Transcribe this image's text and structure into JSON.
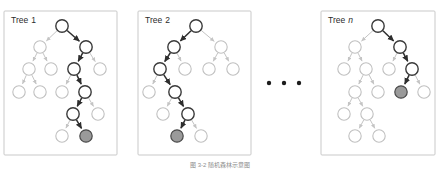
{
  "figure": {
    "caption": "图 3-2  随机森林示意图",
    "ellipsis": "• • •",
    "colors": {
      "panel_border": "#c9c9c9",
      "node_plain_stroke": "#c0c0c0",
      "node_path_stroke": "#3a3a3a",
      "leaf_fill": "#9a9a9a",
      "edge_plain": "#c4c4c4",
      "edge_path": "#2e2e2e",
      "background": "#ffffff",
      "label_text": "#2b2b2b"
    }
  },
  "panels": [
    {
      "id": "tree-1",
      "label_prefix": "Tree",
      "label_value": "1",
      "label_italic": false,
      "box": {
        "x": 4,
        "y": 11,
        "w": 113,
        "h": 144
      },
      "node_r": 6.2,
      "nodes": [
        {
          "id": "n0",
          "x": 62,
          "y": 26,
          "state": "path"
        },
        {
          "id": "n1",
          "x": 40,
          "y": 47,
          "state": "plain"
        },
        {
          "id": "n2",
          "x": 86,
          "y": 47,
          "state": "path"
        },
        {
          "id": "n3",
          "x": 29,
          "y": 69,
          "state": "plain"
        },
        {
          "id": "n4",
          "x": 51,
          "y": 69,
          "state": "plain"
        },
        {
          "id": "n5",
          "x": 74,
          "y": 69,
          "state": "path"
        },
        {
          "id": "n6",
          "x": 100,
          "y": 69,
          "state": "plain"
        },
        {
          "id": "n7",
          "x": 19,
          "y": 92,
          "state": "plain"
        },
        {
          "id": "n8",
          "x": 40,
          "y": 92,
          "state": "plain"
        },
        {
          "id": "n9",
          "x": 62,
          "y": 92,
          "state": "plain"
        },
        {
          "id": "n10",
          "x": 85,
          "y": 92,
          "state": "path"
        },
        {
          "id": "n11",
          "x": 73,
          "y": 114,
          "state": "path"
        },
        {
          "id": "n12",
          "x": 98,
          "y": 114,
          "state": "plain"
        },
        {
          "id": "n13",
          "x": 62,
          "y": 136,
          "state": "plain"
        },
        {
          "id": "n14",
          "x": 86,
          "y": 136,
          "state": "leaf"
        }
      ],
      "edges": [
        {
          "from": "n0",
          "to": "n1",
          "state": "plain"
        },
        {
          "from": "n0",
          "to": "n2",
          "state": "path"
        },
        {
          "from": "n1",
          "to": "n3",
          "state": "plain"
        },
        {
          "from": "n1",
          "to": "n4",
          "state": "plain"
        },
        {
          "from": "n2",
          "to": "n5",
          "state": "path"
        },
        {
          "from": "n2",
          "to": "n6",
          "state": "plain"
        },
        {
          "from": "n3",
          "to": "n7",
          "state": "plain"
        },
        {
          "from": "n3",
          "to": "n8",
          "state": "plain"
        },
        {
          "from": "n5",
          "to": "n9",
          "state": "plain"
        },
        {
          "from": "n5",
          "to": "n10",
          "state": "path"
        },
        {
          "from": "n10",
          "to": "n11",
          "state": "path"
        },
        {
          "from": "n10",
          "to": "n12",
          "state": "plain"
        },
        {
          "from": "n11",
          "to": "n13",
          "state": "plain"
        },
        {
          "from": "n11",
          "to": "n14",
          "state": "path"
        }
      ]
    },
    {
      "id": "tree-2",
      "label_prefix": "Tree",
      "label_value": "2",
      "label_italic": false,
      "box": {
        "x": 138,
        "y": 11,
        "w": 113,
        "h": 144
      },
      "node_r": 6.2,
      "nodes": [
        {
          "id": "n0",
          "x": 196,
          "y": 26,
          "state": "path"
        },
        {
          "id": "n1",
          "x": 174,
          "y": 47,
          "state": "path"
        },
        {
          "id": "n2",
          "x": 221,
          "y": 47,
          "state": "plain"
        },
        {
          "id": "n3",
          "x": 160,
          "y": 69,
          "state": "path"
        },
        {
          "id": "n4",
          "x": 185,
          "y": 69,
          "state": "plain"
        },
        {
          "id": "n5",
          "x": 209,
          "y": 69,
          "state": "plain"
        },
        {
          "id": "n6",
          "x": 233,
          "y": 69,
          "state": "plain"
        },
        {
          "id": "n7",
          "x": 149,
          "y": 92,
          "state": "plain"
        },
        {
          "id": "n8",
          "x": 175,
          "y": 92,
          "state": "path"
        },
        {
          "id": "n9",
          "x": 163,
          "y": 114,
          "state": "plain"
        },
        {
          "id": "n10",
          "x": 188,
          "y": 114,
          "state": "path"
        },
        {
          "id": "n11",
          "x": 177,
          "y": 136,
          "state": "leaf"
        },
        {
          "id": "n12",
          "x": 201,
          "y": 136,
          "state": "plain"
        }
      ],
      "edges": [
        {
          "from": "n0",
          "to": "n1",
          "state": "path"
        },
        {
          "from": "n0",
          "to": "n2",
          "state": "plain"
        },
        {
          "from": "n1",
          "to": "n3",
          "state": "path"
        },
        {
          "from": "n1",
          "to": "n4",
          "state": "plain"
        },
        {
          "from": "n2",
          "to": "n5",
          "state": "plain"
        },
        {
          "from": "n2",
          "to": "n6",
          "state": "plain"
        },
        {
          "from": "n3",
          "to": "n7",
          "state": "plain"
        },
        {
          "from": "n3",
          "to": "n8",
          "state": "path"
        },
        {
          "from": "n8",
          "to": "n9",
          "state": "plain"
        },
        {
          "from": "n8",
          "to": "n10",
          "state": "path"
        },
        {
          "from": "n10",
          "to": "n11",
          "state": "path"
        },
        {
          "from": "n10",
          "to": "n12",
          "state": "plain"
        }
      ]
    },
    {
      "id": "tree-n",
      "label_prefix": "Tree",
      "label_value": "n",
      "label_italic": true,
      "box": {
        "x": 321,
        "y": 11,
        "w": 114,
        "h": 144
      },
      "node_r": 6.2,
      "nodes": [
        {
          "id": "n0",
          "x": 378,
          "y": 26,
          "state": "path"
        },
        {
          "id": "n1",
          "x": 355,
          "y": 47,
          "state": "plain"
        },
        {
          "id": "n2",
          "x": 400,
          "y": 47,
          "state": "path"
        },
        {
          "id": "n3",
          "x": 344,
          "y": 69,
          "state": "plain"
        },
        {
          "id": "n4",
          "x": 366,
          "y": 69,
          "state": "plain"
        },
        {
          "id": "n5",
          "x": 389,
          "y": 69,
          "state": "plain"
        },
        {
          "id": "n6",
          "x": 412,
          "y": 69,
          "state": "path"
        },
        {
          "id": "n7",
          "x": 355,
          "y": 92,
          "state": "plain"
        },
        {
          "id": "n8",
          "x": 378,
          "y": 92,
          "state": "plain"
        },
        {
          "id": "n9",
          "x": 401,
          "y": 92,
          "state": "leaf"
        },
        {
          "id": "n10",
          "x": 424,
          "y": 92,
          "state": "plain"
        },
        {
          "id": "n11",
          "x": 344,
          "y": 114,
          "state": "plain"
        },
        {
          "id": "n12",
          "x": 367,
          "y": 114,
          "state": "plain"
        },
        {
          "id": "n13",
          "x": 355,
          "y": 136,
          "state": "plain"
        },
        {
          "id": "n14",
          "x": 379,
          "y": 136,
          "state": "plain"
        }
      ],
      "edges": [
        {
          "from": "n0",
          "to": "n1",
          "state": "plain"
        },
        {
          "from": "n0",
          "to": "n2",
          "state": "path"
        },
        {
          "from": "n1",
          "to": "n3",
          "state": "plain"
        },
        {
          "from": "n1",
          "to": "n4",
          "state": "plain"
        },
        {
          "from": "n2",
          "to": "n5",
          "state": "plain"
        },
        {
          "from": "n2",
          "to": "n6",
          "state": "path"
        },
        {
          "from": "n4",
          "to": "n7",
          "state": "plain"
        },
        {
          "from": "n4",
          "to": "n8",
          "state": "plain"
        },
        {
          "from": "n6",
          "to": "n9",
          "state": "path"
        },
        {
          "from": "n6",
          "to": "n10",
          "state": "plain"
        },
        {
          "from": "n7",
          "to": "n11",
          "state": "plain"
        },
        {
          "from": "n7",
          "to": "n12",
          "state": "plain"
        },
        {
          "from": "n12",
          "to": "n13",
          "state": "plain"
        },
        {
          "from": "n12",
          "to": "n14",
          "state": "plain"
        }
      ]
    }
  ],
  "ellipsis_dots": [
    {
      "x": 269,
      "y": 83
    },
    {
      "x": 284,
      "y": 83
    },
    {
      "x": 299,
      "y": 83
    }
  ],
  "caption_pos": {
    "x": 220,
    "y": 167
  }
}
